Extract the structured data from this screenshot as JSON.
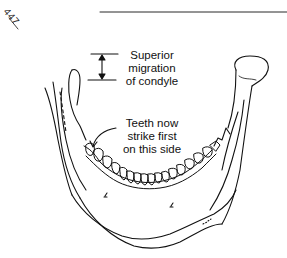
{
  "page": {
    "page_number": "447"
  },
  "diagram": {
    "annotations": [
      {
        "id": "condyle",
        "lines": [
          "Superior",
          "migration",
          "of condyle"
        ]
      },
      {
        "id": "teeth",
        "lines": [
          "Teeth now",
          "strike first",
          "on this side"
        ]
      }
    ],
    "line_color": "#111111",
    "background": "#ffffff"
  }
}
